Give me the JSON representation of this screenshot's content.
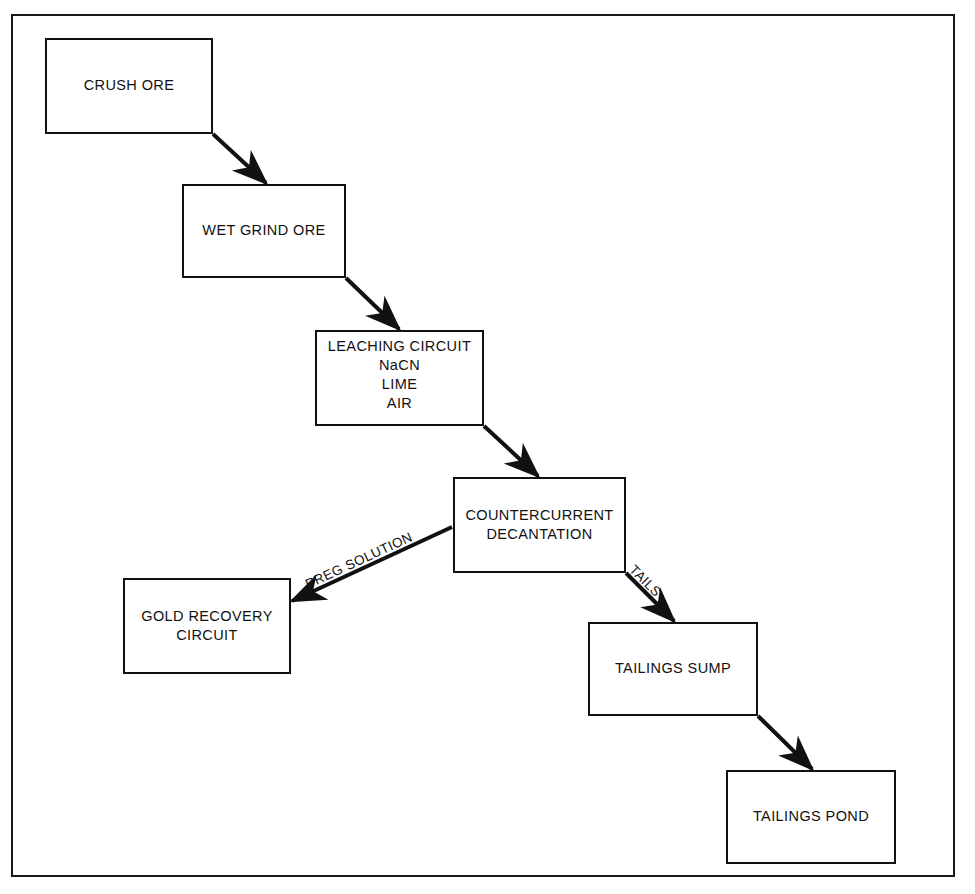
{
  "diagram": {
    "background_color": "#ffffff",
    "line_color": "#111111",
    "frame": {
      "name": "outer-border"
    },
    "nodes": [
      {
        "id": "crush-ore",
        "lines": [
          "CRUSH ORE"
        ],
        "x": 45,
        "y": 38,
        "w": 168,
        "h": 96
      },
      {
        "id": "wet-grind-ore",
        "lines": [
          "WET GRIND ORE"
        ],
        "x": 182,
        "y": 184,
        "w": 164,
        "h": 94
      },
      {
        "id": "leaching-circuit",
        "lines": [
          "LEACHING CIRCUIT",
          "NaCN",
          "LIME",
          "AIR"
        ],
        "x": 315,
        "y": 330,
        "w": 169,
        "h": 96
      },
      {
        "id": "countercurrent-decantation",
        "lines": [
          "COUNTERCURRENT",
          "DECANTATION"
        ],
        "x": 453,
        "y": 477,
        "w": 173,
        "h": 96
      },
      {
        "id": "gold-recovery-circuit",
        "lines": [
          "GOLD RECOVERY",
          "CIRCUIT"
        ],
        "x": 123,
        "y": 578,
        "w": 168,
        "h": 96
      },
      {
        "id": "tailings-sump",
        "lines": [
          "TAILINGS SUMP"
        ],
        "x": 588,
        "y": 622,
        "w": 170,
        "h": 94
      },
      {
        "id": "tailings-pond",
        "lines": [
          "TAILINGS POND"
        ],
        "x": 726,
        "y": 770,
        "w": 170,
        "h": 94
      }
    ],
    "edges": [
      {
        "id": "crush-to-grind",
        "from": "crush-ore",
        "to": "wet-grind-ore",
        "label": ""
      },
      {
        "id": "grind-to-leach",
        "from": "wet-grind-ore",
        "to": "leaching-circuit",
        "label": ""
      },
      {
        "id": "leach-to-ccd",
        "from": "leaching-circuit",
        "to": "countercurrent-decantation",
        "label": ""
      },
      {
        "id": "ccd-to-gold-recovery",
        "from": "countercurrent-decantation",
        "to": "gold-recovery-circuit",
        "label": "PREG SOLUTION"
      },
      {
        "id": "ccd-to-tailings-sump",
        "from": "countercurrent-decantation",
        "to": "tailings-sump",
        "label": "TAILS"
      },
      {
        "id": "sump-to-pond",
        "from": "tailings-sump",
        "to": "tailings-pond",
        "label": ""
      }
    ],
    "labels": {
      "preg_solution": "PREG SOLUTION",
      "tails": "TAILS"
    }
  }
}
